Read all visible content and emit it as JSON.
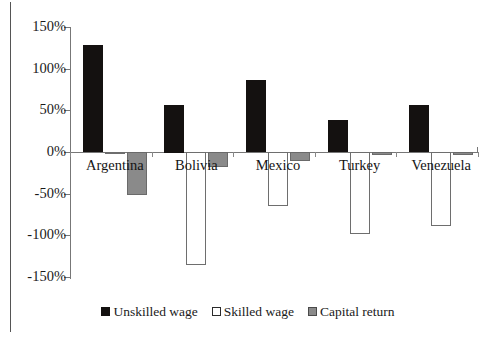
{
  "chart_data": {
    "type": "bar",
    "title": "",
    "subtitle": "",
    "xlabel": "",
    "ylabel": "",
    "categories": [
      "Argentina",
      "Bolivia",
      "Mexico",
      "Turkey",
      "Venezuela"
    ],
    "series": [
      {
        "name": "Unskilled wage",
        "color": "#141110",
        "style": "filled-black",
        "values": [
          128,
          57,
          86,
          38,
          56
        ]
      },
      {
        "name": "Skilled wage",
        "color": "#ffffff",
        "style": "outline-white",
        "values": [
          -1,
          -135,
          -65,
          -98,
          -89
        ]
      },
      {
        "name": "Capital return",
        "color": "#8a8a8a",
        "style": "filled-gray",
        "values": [
          -52,
          -18,
          -11,
          -3,
          -4
        ]
      }
    ],
    "ylim": [
      -150,
      150
    ],
    "yticks": [
      150,
      100,
      50,
      0,
      -50,
      -100,
      -150
    ],
    "ytick_labels": [
      "150%",
      "100%",
      "50%",
      "0%",
      "-50%",
      "-100%",
      "-150%"
    ],
    "value_suffix": "%",
    "grid": false,
    "legend_position": "bottom-center",
    "zero_line": true,
    "axis_color": "#777777",
    "frame": "left-border-only"
  },
  "legend": {
    "items": [
      {
        "label": "Unskilled wage",
        "swatch": "black"
      },
      {
        "label": "Skilled wage",
        "swatch": "white"
      },
      {
        "label": "Capital return",
        "swatch": "gray"
      }
    ]
  }
}
